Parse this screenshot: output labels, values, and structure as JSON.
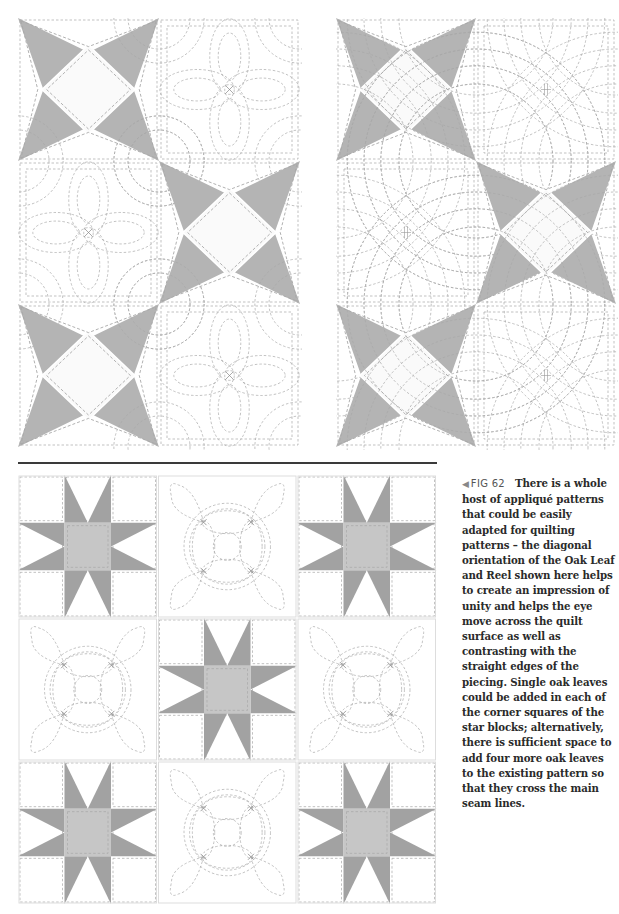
{
  "page": {
    "background": "#ffffff"
  },
  "figures": {
    "top_left": {
      "description": "Quilt layout alternating star blocks with orange-peel quilted plain blocks",
      "rows": 3,
      "cols": 2,
      "pattern": [
        [
          "star",
          "orange-peel"
        ],
        [
          "orange-peel",
          "star"
        ],
        [
          "star",
          "orange-peel"
        ]
      ]
    },
    "top_right": {
      "description": "Quilt layout alternating star blocks with curved feathered-petal quilted plain blocks",
      "rows": 3,
      "cols": 2,
      "pattern": [
        [
          "star",
          "petal-fan"
        ],
        [
          "petal-fan",
          "star"
        ],
        [
          "star",
          "petal-fan"
        ]
      ]
    },
    "bottom": {
      "description": "Eight-point star blocks alternating with Oak Leaf and Reel quilted blocks",
      "rows": 3,
      "cols": 3,
      "pattern": [
        [
          "eight-point-star",
          "oak-leaf-reel",
          "eight-point-star"
        ],
        [
          "oak-leaf-reel",
          "eight-point-star",
          "oak-leaf-reel"
        ],
        [
          "eight-point-star",
          "oak-leaf-reel",
          "eight-point-star"
        ]
      ]
    }
  },
  "colors": {
    "star_gray": "#b4b4b4",
    "eight_star_gray": "#a2a2a2",
    "center_square_gray": "#c6c6c6",
    "diamond_fill": "#fafafa",
    "stitch": "#a8a8a8",
    "rule": "#3a3a3a",
    "text": "#2a2a2a"
  },
  "caption": {
    "arrow": "◀",
    "figure_label": "FIG 62",
    "text": "There is a whole host of appliqué patterns that could be easily adapted for quilting patterns – the diagonal orientation of the Oak Leaf and Reel shown here helps to create an impression of unity and helps the eye move across the quilt surface as well as contrasting with the straight edges of the piecing. Single oak leaves could be added in each of the corner squares of the star blocks; alternatively, there is sufficient space to add four more oak leaves to the existing pattern so that they cross the main seam lines."
  }
}
